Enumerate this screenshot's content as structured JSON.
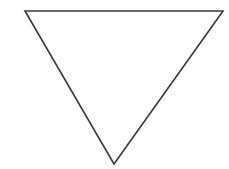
{
  "figure": {
    "width": 229,
    "height": 169,
    "background_color": "#ffffff",
    "shapes": [
      {
        "name": "inverted-triangle",
        "type": "polygon",
        "label": "Downward-pointing triangle",
        "stroke_color": "#3a3a3a",
        "stroke_width": 1.6,
        "fill": "none",
        "points": "25,11 223,11 114,164",
        "vertices": [
          {
            "name": "top-left-vertex",
            "x": 25,
            "y": 11
          },
          {
            "name": "top-right-vertex",
            "x": 223,
            "y": 11
          },
          {
            "name": "bottom-vertex",
            "x": 114,
            "y": 164
          }
        ]
      }
    ]
  }
}
